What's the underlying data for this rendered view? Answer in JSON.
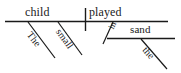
{
  "diagram": {
    "type": "reed-kellogg-sentence-diagram",
    "sentence": "The small child played in the sand.",
    "ink_color": "#1a1a1a",
    "background_color": "#ffffff",
    "words": {
      "subject": "child",
      "verb": "played",
      "subject_article": "The",
      "subject_adjective": "small",
      "preposition": "in",
      "object_of_preposition": "sand",
      "object_article": "the"
    },
    "lines": {
      "baseline_label": "main-baseline",
      "subject_verb_divider_label": "subject-verb-divider",
      "prepositional_object_line_label": "prepositional-object-line"
    }
  }
}
